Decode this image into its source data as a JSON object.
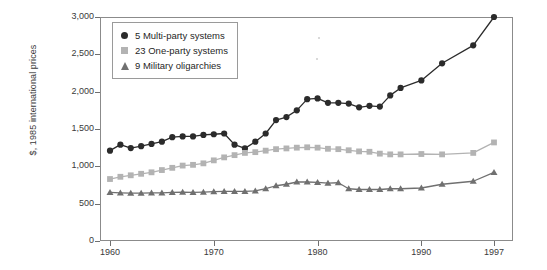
{
  "chart_data": {
    "type": "line",
    "title": "",
    "xlabel": "",
    "ylabel": "$, 1985 international prices",
    "xlim": [
      1960,
      1997
    ],
    "ylim": [
      0,
      3000
    ],
    "xticks": [
      1960,
      1970,
      1980,
      1990,
      1997
    ],
    "xtick_labels": [
      "1960",
      "1970",
      "1980",
      "1990",
      "1997"
    ],
    "yticks": [
      0,
      500,
      1000,
      1500,
      2000,
      2500,
      3000
    ],
    "ytick_labels": [
      "0",
      "500",
      "1,000",
      "1,500",
      "2,000",
      "2,500",
      "3,000"
    ],
    "grid": false,
    "legend_position": "top-left",
    "x": [
      1960,
      1961,
      1962,
      1963,
      1964,
      1965,
      1966,
      1967,
      1968,
      1969,
      1970,
      1971,
      1972,
      1973,
      1974,
      1975,
      1976,
      1977,
      1978,
      1979,
      1980,
      1981,
      1982,
      1983,
      1984,
      1985,
      1986,
      1987,
      1988,
      1990,
      1992,
      1995,
      1997
    ],
    "series": [
      {
        "name": "5 Multi-party systems",
        "legend_label": "5 Multi-party systems",
        "marker": "circle",
        "color": "#2b2b2b",
        "values": [
          1210,
          1290,
          1245,
          1270,
          1300,
          1330,
          1390,
          1400,
          1400,
          1420,
          1430,
          1440,
          1290,
          1240,
          1330,
          1440,
          1620,
          1660,
          1750,
          1900,
          1910,
          1850,
          1850,
          1840,
          1790,
          1810,
          1800,
          1950,
          2050,
          2150,
          2380,
          2620,
          3000
        ]
      },
      {
        "name": "23 One-party systems",
        "legend_label": "23 One-party systems",
        "marker": "square",
        "color": "#b3b3b3",
        "values": [
          830,
          860,
          880,
          900,
          920,
          950,
          980,
          1010,
          1020,
          1040,
          1080,
          1120,
          1150,
          1180,
          1190,
          1210,
          1230,
          1240,
          1250,
          1255,
          1250,
          1235,
          1230,
          1215,
          1200,
          1195,
          1170,
          1160,
          1160,
          1165,
          1160,
          1180,
          1320
        ]
      },
      {
        "name": "9 Military oligarchies",
        "legend_label": "9 Military oligarchies",
        "marker": "triangle",
        "color": "#707070",
        "values": [
          650,
          645,
          640,
          640,
          645,
          645,
          650,
          655,
          650,
          655,
          660,
          665,
          665,
          665,
          670,
          700,
          740,
          760,
          790,
          790,
          785,
          775,
          780,
          700,
          690,
          690,
          690,
          700,
          700,
          710,
          760,
          800,
          920
        ]
      }
    ]
  }
}
